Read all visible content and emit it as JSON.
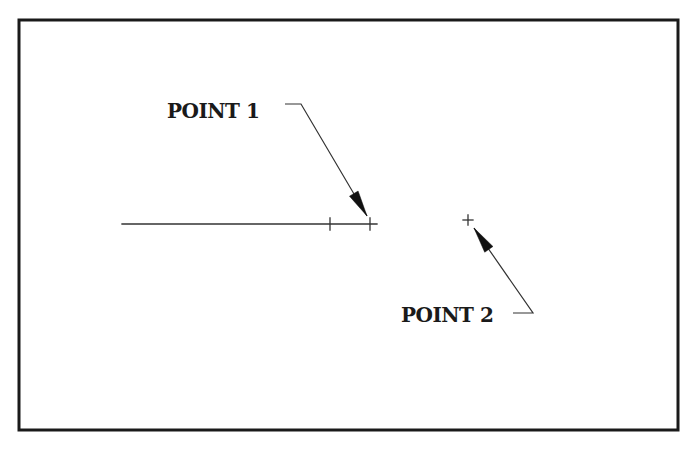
{
  "frame": {
    "x": 19,
    "y": 20,
    "width": 659,
    "height": 410,
    "border_color": "#1a1a1a",
    "background": "#ffffff"
  },
  "line": {
    "x1": 122,
    "y1": 224,
    "x2": 377,
    "y2": 224
  },
  "line_ticks": [
    {
      "x": 330,
      "y": 224
    },
    {
      "x": 370,
      "y": 224
    }
  ],
  "points": [
    {
      "id": "point1",
      "label": "POINT 1",
      "label_x": 167,
      "label_y": 118,
      "font_size": 20,
      "marker": {
        "x": 370,
        "y": 224
      },
      "leader": {
        "shoulder_start": [
          285,
          104
        ],
        "shoulder_end": [
          301,
          104
        ],
        "tip": [
          367,
          216
        ]
      }
    },
    {
      "id": "point2",
      "label": "POINT 2",
      "label_x": 401,
      "label_y": 322,
      "font_size": 20,
      "marker": {
        "x": 468,
        "y": 220
      },
      "leader": {
        "shoulder_start": [
          513,
          313
        ],
        "shoulder_end": [
          533,
          313
        ],
        "tip": [
          474,
          228
        ]
      }
    }
  ],
  "colors": {
    "ink": "#1a1a1a",
    "line": "#333333",
    "arrow": "#111111"
  }
}
